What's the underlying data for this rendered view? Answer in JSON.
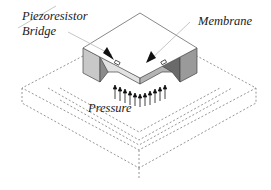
{
  "figure": {
    "labels": {
      "piezoresistor_line1": "Piezoresistor",
      "piezoresistor_line2": "Bridge",
      "membrane": "Membrane",
      "pressure": "Pressure"
    },
    "colors": {
      "top_face": "#ffffff",
      "left_face": "#c8c8c8",
      "right_face": "#9a9a9a",
      "notch_dark": "#6a6a6a",
      "membrane_edge_left": "#d8d8d8",
      "membrane_edge_right": "#b0b0b0",
      "dashed_outline": "#8a8a8a",
      "arrow": "#111111"
    },
    "pressure_arrow_count": 12
  }
}
